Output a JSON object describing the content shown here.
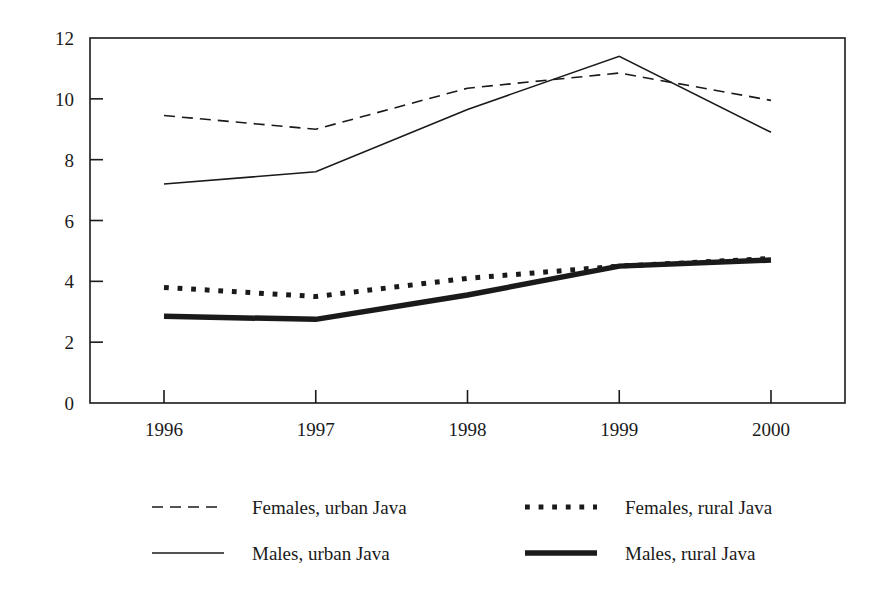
{
  "chart_data": {
    "type": "line",
    "title": "",
    "subtitle": "",
    "xlabel": "",
    "ylabel": "",
    "categories": [
      "1996",
      "1997",
      "1998",
      "1999",
      "2000"
    ],
    "x_tick_labels": [
      "1996",
      "1997",
      "1998",
      "1999",
      "2000"
    ],
    "y_tick_labels": [
      "0",
      "2",
      "4",
      "6",
      "8",
      "10",
      "12"
    ],
    "y_ticks": [
      0,
      2,
      4,
      6,
      8,
      10,
      12
    ],
    "ylim": [
      0,
      12
    ],
    "grid": false,
    "legend_position": "bottom",
    "axis_color": "#1a1a1a",
    "background_color": "#ffffff",
    "series": [
      {
        "name": "Females, urban Java",
        "style": "dashed",
        "color": "#1a1a1a",
        "width": 1.6,
        "values": [
          9.45,
          9.0,
          10.35,
          10.85,
          9.95
        ]
      },
      {
        "name": "Males, urban Java",
        "style": "solid",
        "color": "#1a1a1a",
        "width": 1.6,
        "values": [
          7.2,
          7.6,
          9.65,
          11.4,
          8.9
        ]
      },
      {
        "name": "Females, rural Java",
        "style": "dotted",
        "color": "#1a1a1a",
        "width": 5.0,
        "values": [
          3.8,
          3.5,
          4.1,
          4.5,
          4.75
        ]
      },
      {
        "name": "Males, rural Java",
        "style": "solid",
        "color": "#1a1a1a",
        "width": 5.5,
        "values": [
          2.85,
          2.75,
          3.55,
          4.5,
          4.7
        ]
      }
    ]
  },
  "legend": {
    "entries": [
      {
        "label": "Females, urban Java",
        "series_index": 0
      },
      {
        "label": "Females, rural Java",
        "series_index": 2
      },
      {
        "label": "Males, urban Java",
        "series_index": 1
      },
      {
        "label": "Males, rural Java",
        "series_index": 3
      }
    ]
  },
  "y_axis": {
    "labels": [
      "12",
      "10",
      "8",
      "6",
      "4",
      "2",
      "0"
    ]
  },
  "x_axis": {
    "labels": [
      "1996",
      "1997",
      "1998",
      "1999",
      "2000"
    ]
  }
}
